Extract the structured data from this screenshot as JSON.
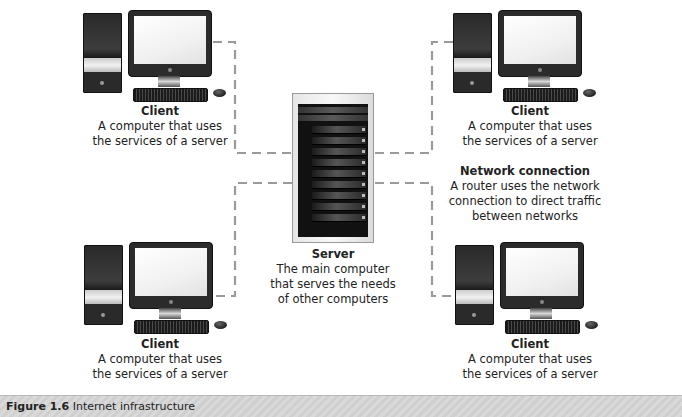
{
  "diagram": {
    "line_color": "#9a9a9a",
    "nodes": {
      "client_top_left": {
        "title": "Client",
        "description": "A computer that uses\nthe services of a server"
      },
      "client_top_right": {
        "title": "Client",
        "description": "A computer that uses\nthe services of a server"
      },
      "client_bottom_left": {
        "title": "Client",
        "description": "A computer that uses\nthe services of a server"
      },
      "client_bottom_right": {
        "title": "Client",
        "description": "A computer that uses\nthe services of a server"
      },
      "server": {
        "title": "Server",
        "description": "The main computer\nthat serves the needs\nof other computers"
      }
    },
    "annotations": {
      "network_connection": {
        "title": "Network connection",
        "description": "A router uses the network\nconnection to direct traffic\nbetween networks"
      }
    },
    "edges": [
      {
        "from": "client_top_left",
        "to": "server",
        "style": "dashed"
      },
      {
        "from": "client_top_right",
        "to": "server",
        "style": "dashed"
      },
      {
        "from": "client_bottom_left",
        "to": "server",
        "style": "dashed"
      },
      {
        "from": "client_bottom_right",
        "to": "server",
        "style": "dashed"
      }
    ],
    "icons": {
      "client": "desktop-computer-icon",
      "server": "server-tower-icon"
    }
  },
  "caption": {
    "figure_label": "Figure 1.6",
    "text": "Internet infrastructure"
  }
}
